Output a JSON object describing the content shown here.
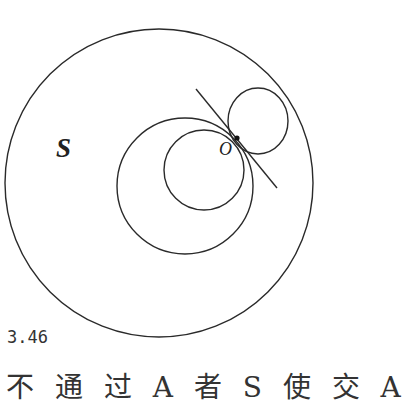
{
  "figure": {
    "label": "3.46",
    "region_label": "S",
    "point_label": "O",
    "caption_partial": "不 通 过 A 者 S 使 交 A"
  },
  "shapes": {
    "outer_circle": {
      "cx": 159,
      "cy": 183,
      "r": 154
    },
    "medium_circle": {
      "cx": 185,
      "cy": 186,
      "r": 68
    },
    "inner_circle": {
      "cx": 204,
      "cy": 170,
      "r": 40
    },
    "upper_circle": {
      "cx": 258,
      "cy": 121,
      "rx": 30,
      "ry": 33
    },
    "tangent_line": {
      "x1": 196,
      "y1": 89,
      "x2": 277,
      "y2": 188
    },
    "point_O": {
      "cx": 237,
      "cy": 138
    }
  },
  "colors": {
    "stroke": "#2a2a2a",
    "background": "#ffffff"
  }
}
